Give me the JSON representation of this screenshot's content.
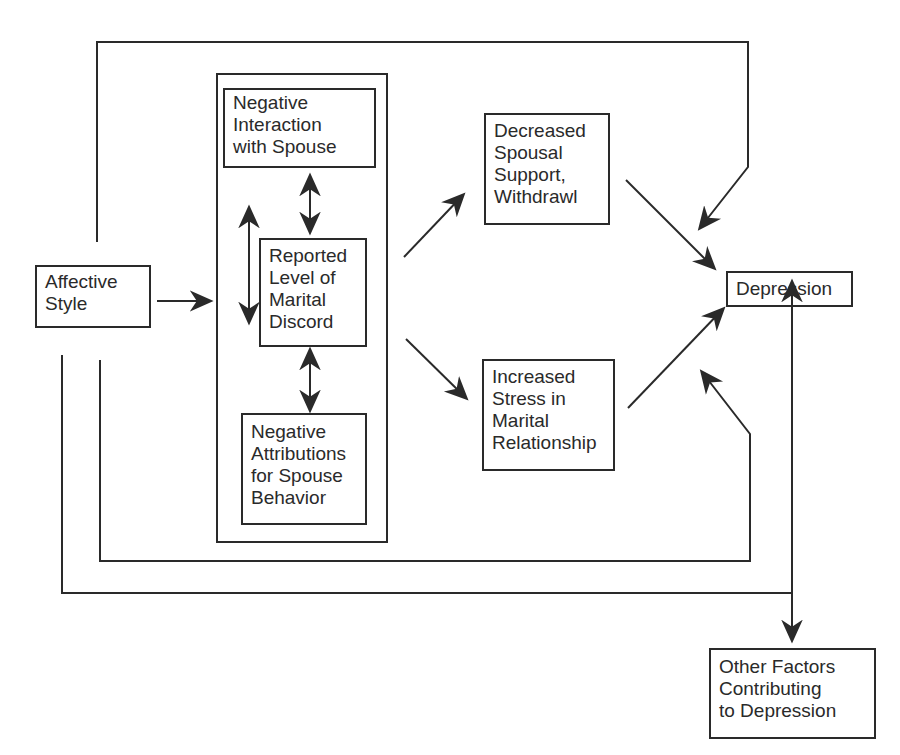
{
  "diagram": {
    "type": "path-model",
    "nodes": {
      "affective_style": {
        "lines": [
          "Affective",
          "Style"
        ]
      },
      "negative_interaction": {
        "lines": [
          "Negative",
          "Interaction",
          "with Spouse"
        ]
      },
      "reported_discord": {
        "lines": [
          "Reported",
          "Level of",
          "Marital",
          "Discord"
        ]
      },
      "negative_attributions": {
        "lines": [
          "Negative",
          "Attributions",
          "for Spouse",
          "Behavior"
        ]
      },
      "decreased_support": {
        "lines": [
          "Decreased",
          "Spousal",
          "Support,",
          "Withdrawl"
        ]
      },
      "increased_stress": {
        "lines": [
          "Increased",
          "Stress in",
          "Marital",
          "Relationship"
        ]
      },
      "depression": {
        "lines": [
          "Depression"
        ]
      },
      "other_factors": {
        "lines": [
          "Other Factors",
          "Contributing",
          "to Depression"
        ]
      }
    },
    "edges": [
      {
        "from": "affective_style",
        "to": "marital_discord_group",
        "type": "directed"
      },
      {
        "from": "negative_interaction",
        "to": "reported_discord",
        "type": "bidirectional"
      },
      {
        "from": "reported_discord",
        "to": "negative_attributions",
        "type": "bidirectional"
      },
      {
        "from": "negative_interaction",
        "to": "negative_attributions",
        "type": "bidirectional"
      },
      {
        "from": "marital_discord_group",
        "to": "decreased_support",
        "type": "directed"
      },
      {
        "from": "marital_discord_group",
        "to": "increased_stress",
        "type": "directed"
      },
      {
        "from": "decreased_support",
        "to": "depression",
        "type": "directed"
      },
      {
        "from": "increased_stress",
        "to": "depression",
        "type": "directed"
      },
      {
        "from": "affective_style",
        "to": "depression",
        "type": "directed",
        "route": "top-loop"
      },
      {
        "from": "affective_style",
        "to": "depression",
        "type": "directed",
        "route": "bottom-loop"
      },
      {
        "from": "affective_style",
        "to": "other_factors",
        "type": "directed",
        "route": "outer-bottom-loop"
      },
      {
        "from": "other_factors",
        "to": "depression",
        "type": "bidirectional"
      }
    ],
    "colors": {
      "ink": "#2a2a2a",
      "background": "#ffffff"
    }
  }
}
